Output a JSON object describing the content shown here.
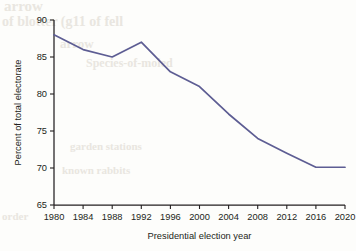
{
  "figure": {
    "background_color": "#fdfdfb",
    "line_color": "#5d5d93",
    "text_color": "#231f20"
  },
  "ghost_artifacts": {
    "note": "faint bleed-through text from reverse of scanned page",
    "lines": [
      "arrow",
      "of blotter  (g11 of fell",
      "arrow",
      "Species-of-moled",
      "garden  stations",
      "known  rabbits",
      "order"
    ]
  },
  "chart_data": {
    "type": "line",
    "title": "",
    "xlabel": "Presidential election year",
    "ylabel": "Percent of total electorate",
    "xlim": [
      1980,
      2020
    ],
    "ylim": [
      65,
      90
    ],
    "xticks": [
      1980,
      1984,
      1988,
      1992,
      1996,
      2000,
      2004,
      2008,
      2012,
      2016,
      2020
    ],
    "xtick_labels": [
      "1980",
      "1984",
      "1988",
      "1992",
      "1996",
      "2000",
      "2004",
      "2008",
      "2012",
      "2016",
      "2020"
    ],
    "yticks": [
      65,
      70,
      75,
      80,
      85,
      90
    ],
    "ytick_labels": [
      "65",
      "70",
      "75",
      "80",
      "85",
      "90"
    ],
    "grid": false,
    "legend": null,
    "series": [
      {
        "name": "Percent of total electorate",
        "color": "#5d5d93",
        "x": [
          1980,
          1984,
          1988,
          1992,
          1996,
          2000,
          2004,
          2008,
          2012,
          2016,
          2020
        ],
        "values": [
          88.0,
          86.0,
          85.0,
          87.0,
          83.0,
          81.0,
          77.3,
          74.0,
          72.0,
          70.1,
          70.1
        ]
      }
    ]
  }
}
